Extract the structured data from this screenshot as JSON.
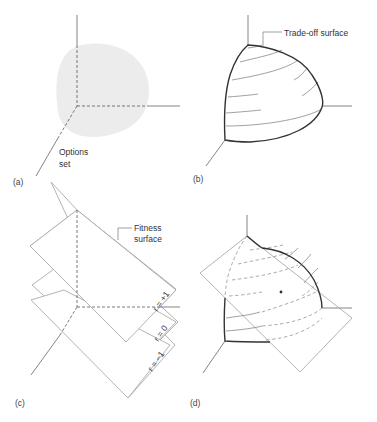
{
  "figure": {
    "panels": [
      {
        "id": "a",
        "label": "(a)",
        "annotation_lines": [
          "Options",
          "set"
        ]
      },
      {
        "id": "b",
        "label": "(b)",
        "annotation": "Trade-off surface"
      },
      {
        "id": "c",
        "label": "(c)",
        "annotation_lines": [
          "Fitness",
          "surface"
        ],
        "plane_labels": [
          "r = +1",
          "r = 0",
          "r = −1"
        ]
      },
      {
        "id": "d",
        "label": "(d)",
        "marker": "optimum-point"
      }
    ],
    "colors": {
      "options_set_fill": "#ececec",
      "trade_off_surface_stroke": "#333333",
      "fitness_plane_stroke": "#aaaaaa",
      "axis_stroke": "#666666"
    }
  }
}
